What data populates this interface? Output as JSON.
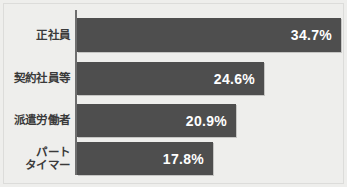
{
  "chart_data": {
    "type": "bar",
    "orientation": "horizontal",
    "title": "",
    "subtitle": "",
    "xlabel": "",
    "ylabel": "",
    "categories": [
      "正社員",
      "契約社員等",
      "派遣労働者",
      "パート\nタイマー"
    ],
    "values": [
      34.7,
      24.6,
      20.9,
      17.8
    ],
    "value_labels": [
      "34.7%",
      "24.6%",
      "20.9%",
      "17.8%"
    ],
    "unit": "%",
    "xlim": [
      0,
      34.7
    ],
    "grid": false,
    "legend": false,
    "legend_position": "none",
    "bars": [
      {
        "category": "正社員",
        "value": 34.7,
        "label": "34.7%"
      },
      {
        "category": "契約社員等",
        "value": 24.6,
        "label": "24.6%"
      },
      {
        "category": "派遣労働者",
        "value": 20.9,
        "label": "20.9%"
      },
      {
        "category": "パート\nタイマー",
        "value": 17.8,
        "label": "17.8%"
      }
    ]
  },
  "colors": {
    "background": "#eeeeec",
    "bar": "#4e4e4e",
    "axis": "#6e6e6e",
    "category_text": "#3a3a3a",
    "value_text": "#ffffff"
  }
}
